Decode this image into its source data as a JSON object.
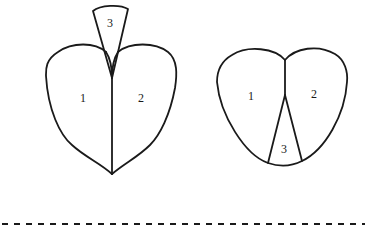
{
  "diagram": {
    "left_figure": {
      "regions": [
        {
          "label": "1"
        },
        {
          "label": "2"
        },
        {
          "label": "3"
        }
      ]
    },
    "right_figure": {
      "regions": [
        {
          "label": "1"
        },
        {
          "label": "2"
        },
        {
          "label": "3"
        }
      ]
    },
    "separator": "dashed-line",
    "colors": {
      "line": "#1a1a1a",
      "background": "#ffffff"
    }
  }
}
